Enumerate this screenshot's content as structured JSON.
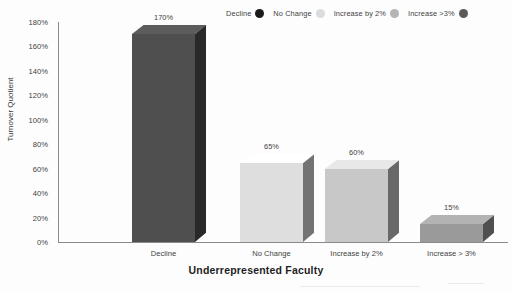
{
  "chart_data": {
    "type": "bar",
    "title": "",
    "subtitle": "",
    "xlabel": "Underrepresented Faculty",
    "ylabel": "Turnover Quotient",
    "categories": [
      "Decline",
      "No Change",
      "Increase by 2%",
      "Increase > 3%"
    ],
    "values": [
      170,
      65,
      60,
      15
    ],
    "value_labels": [
      "170%",
      "65%",
      "60%",
      "15%"
    ],
    "ylim": [
      0,
      180
    ],
    "ytick_labels": [
      "0%",
      "20%",
      "40%",
      "60%",
      "80%",
      "100%",
      "120%",
      "140%",
      "160%",
      "180%"
    ],
    "ytick_values": [
      0,
      20,
      40,
      60,
      80,
      100,
      120,
      140,
      160,
      180
    ],
    "grid": false,
    "legend_position": "top-right",
    "style": "3d-column",
    "series": [
      {
        "name": "Turnover Quotient",
        "values": [
          170,
          65,
          60,
          15
        ],
        "colors": [
          "#4f4f4f",
          "#dedede",
          "#c8c8c8",
          "#9a9a9a"
        ]
      }
    ]
  },
  "legend": {
    "items": [
      {
        "label": "Decline",
        "color": "#1a1a1a"
      },
      {
        "label": "No Change",
        "color": "#dcdcdc"
      },
      {
        "label": "Increase by 2%",
        "color": "#b4b4b4"
      },
      {
        "label": "Increase >3%",
        "color": "#5a5a5a"
      }
    ]
  },
  "axes": {
    "y_title": "Turnover Quotient",
    "x_title": "Underrepresented Faculty"
  },
  "colors": {
    "axis": "#8a8a8a",
    "text": "#3f3f3f",
    "background": "#fdfdfd"
  }
}
